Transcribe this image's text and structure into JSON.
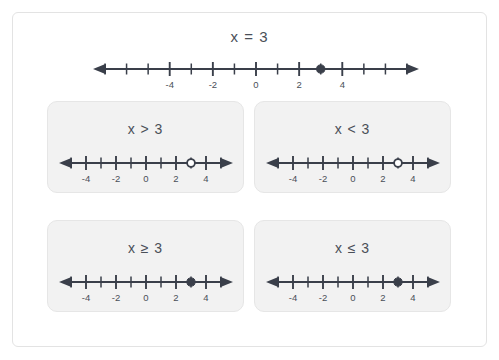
{
  "colors": {
    "ink": "#3a3f4a",
    "text": "#4a4f58",
    "card_bg": "#f2f2f2",
    "card_border": "#e6e6e6",
    "frame_border": "#e3e3e3",
    "page_bg": "#ffffff"
  },
  "header": {
    "title": "x = 3",
    "numberline": {
      "min": -7,
      "max": 7,
      "tick_step": 1,
      "labels": [
        "-4",
        "-2",
        "0",
        "2",
        "4"
      ],
      "label_values": [
        -4,
        -2,
        0,
        2,
        4
      ],
      "point_value": 3,
      "point_style": "closed",
      "ray": "none",
      "left_arrow": true,
      "right_arrow": true
    }
  },
  "cards": [
    {
      "id": "greater-than",
      "label": "x > 3",
      "numberline": {
        "min": -5,
        "max": 5,
        "tick_step": 1,
        "labels": [
          "-4",
          "-2",
          "0",
          "2",
          "4"
        ],
        "label_values": [
          -4,
          -2,
          0,
          2,
          4
        ],
        "point_value": 3,
        "point_style": "open",
        "ray": "none",
        "left_arrow": true,
        "right_arrow": true
      }
    },
    {
      "id": "less-than",
      "label": "x < 3",
      "numberline": {
        "min": -5,
        "max": 5,
        "tick_step": 1,
        "labels": [
          "-4",
          "-2",
          "0",
          "2",
          "4"
        ],
        "label_values": [
          -4,
          -2,
          0,
          2,
          4
        ],
        "point_value": 3,
        "point_style": "open",
        "ray": "none",
        "left_arrow": true,
        "right_arrow": true
      }
    },
    {
      "id": "greater-or-equal",
      "label": "x ≥ 3",
      "numberline": {
        "min": -5,
        "max": 5,
        "tick_step": 1,
        "labels": [
          "-4",
          "-2",
          "0",
          "2",
          "4"
        ],
        "label_values": [
          -4,
          -2,
          0,
          2,
          4
        ],
        "point_value": 3,
        "point_style": "closed",
        "ray": "none",
        "left_arrow": true,
        "right_arrow": true
      }
    },
    {
      "id": "less-or-equal",
      "label": "x ≤ 3",
      "numberline": {
        "min": -5,
        "max": 5,
        "tick_step": 1,
        "labels": [
          "-4",
          "-2",
          "0",
          "2",
          "4"
        ],
        "label_values": [
          -4,
          -2,
          0,
          2,
          4
        ],
        "point_value": 3,
        "point_style": "closed",
        "ray": "none",
        "left_arrow": true,
        "right_arrow": true
      }
    }
  ]
}
